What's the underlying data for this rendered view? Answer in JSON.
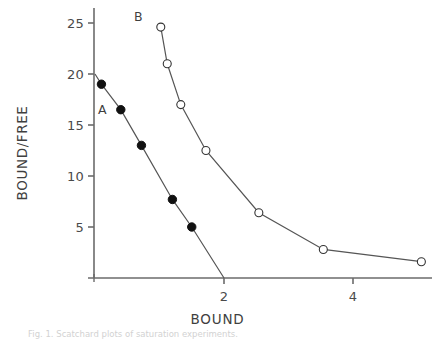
{
  "chart_data": {
    "type": "line",
    "title": "",
    "subtitle": "",
    "xlabel": "BOUND",
    "ylabel": "BOUND/FREE",
    "xlim": [
      0,
      5.27
    ],
    "ylim": [
      0,
      25.5
    ],
    "grid": false,
    "legend_position": "inline-annotations",
    "x_ticks": [
      2,
      4
    ],
    "x_tick_labels": [
      "2",
      "4"
    ],
    "y_ticks": [
      5,
      10,
      15,
      20,
      25
    ],
    "y_tick_labels": [
      "5",
      "10",
      "15",
      "20",
      "25"
    ],
    "annotations": [
      {
        "text": "A",
        "x": 0.06,
        "y": 16.2
      },
      {
        "text": "B",
        "x": 0.7,
        "y": 24.4
      }
    ],
    "series": [
      {
        "name": "A",
        "marker": "filled-circle",
        "marker_color": "#111111",
        "line_color": "#555555",
        "x": [
          0.1,
          0.4,
          0.72,
          1.2,
          1.5
        ],
        "values": [
          19.0,
          16.5,
          13.0,
          7.7,
          5.0
        ],
        "line_x": [
          0.0,
          0.1,
          0.4,
          0.72,
          1.2,
          1.5,
          2.0
        ],
        "line_y": [
          20.0,
          19.0,
          16.5,
          13.0,
          7.7,
          5.0,
          0.0
        ]
      },
      {
        "name": "B",
        "marker": "open-circle",
        "marker_color": "#ffffff",
        "line_color": "#555555",
        "x": [
          1.02,
          1.12,
          1.33,
          1.72,
          2.54,
          3.54,
          5.06
        ],
        "values": [
          24.6,
          21.0,
          17.0,
          12.5,
          6.4,
          2.8,
          1.6
        ],
        "line_x": [
          1.02,
          1.12,
          1.33,
          1.72,
          2.54,
          3.54,
          5.06
        ],
        "line_y": [
          24.6,
          21.0,
          17.0,
          12.5,
          6.4,
          2.8,
          1.6
        ]
      }
    ]
  },
  "axes": {
    "x_title": "BOUND",
    "y_title": "BOUND/FREE"
  },
  "caption": {
    "text": "Fig. 1. Scatchard plots of saturation experiments."
  },
  "colors": {
    "axis": "#6b6b6b",
    "line": "#555555",
    "text": "#3f3f3f",
    "marker_filled": "#111111",
    "marker_open_fill": "#ffffff"
  }
}
